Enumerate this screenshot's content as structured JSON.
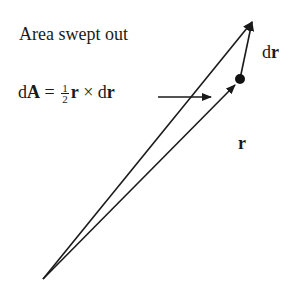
{
  "diagram": {
    "title_label": "Area swept out",
    "equation": {
      "lhs_d": "d",
      "lhs_A": "A",
      "equals": "=",
      "frac_num": "1",
      "frac_den": "2",
      "r": "r",
      "cross": "×",
      "d": "d",
      "r2": "r"
    },
    "vector_r_label": "r",
    "vector_dr_label_d": "d",
    "vector_dr_label_r": "r",
    "colors": {
      "line": "#1a1a1a",
      "background": "#ffffff"
    },
    "geometry": {
      "origin": [
        43,
        279
      ],
      "r_tip": [
        240,
        79
      ],
      "r_plus_dr_tip": [
        253,
        20
      ],
      "pointer_arrow": {
        "from": [
          158,
          97
        ],
        "to": [
          212,
          97
        ]
      }
    }
  }
}
